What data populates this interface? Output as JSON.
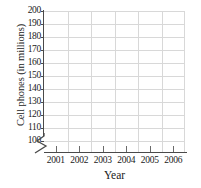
{
  "chart_data": {
    "type": "line",
    "title": "",
    "subtitle": "",
    "xlabel": "Year",
    "ylabel": "Cell phones (in millions)",
    "x_tick_labels": [
      "2001",
      "2002",
      "2003",
      "2004",
      "2005",
      "2006"
    ],
    "y_tick_labels": [
      "200",
      "190",
      "180",
      "170",
      "160",
      "150",
      "140",
      "130",
      "120",
      "110",
      "100"
    ],
    "xlim": [
      2000.5,
      2006.5
    ],
    "ylim": [
      100,
      200
    ],
    "y_tick_values": [
      200,
      190,
      180,
      170,
      160,
      150,
      140,
      130,
      120,
      110,
      100
    ],
    "x_tick_values": [
      2001,
      2002,
      2003,
      2004,
      2005,
      2006
    ],
    "grid": true,
    "grid_color": "#d8d8d8",
    "axis_color": "#4a4a4a",
    "axis_break": "y-axis break below 100",
    "legend": null,
    "series": [],
    "values": [],
    "annotations": [],
    "note": "Empty plotting grid with no data plotted"
  },
  "axes": {
    "y_title": "Cell phones (in millions)",
    "x_title": "Year"
  },
  "icons": {
    "axis_break": "axis-break-zigzag-icon"
  }
}
